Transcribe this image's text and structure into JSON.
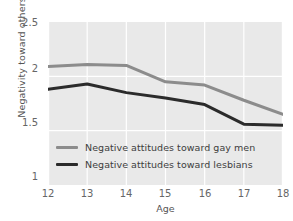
{
  "chart_data": {
    "type": "line",
    "title": "",
    "xlabel": "Age",
    "ylabel": "Negativity toward others",
    "x": [
      12,
      13,
      14,
      15,
      16,
      17,
      18
    ],
    "xticklabels": [
      "12",
      "13",
      "14",
      "15",
      "16",
      "17",
      "18"
    ],
    "yticklabels": [
      "1",
      "1.5",
      "2",
      "2.5"
    ],
    "yticks": [
      1,
      1.5,
      2,
      2.5
    ],
    "xlim": [
      12,
      18
    ],
    "ylim": [
      1,
      2.5
    ],
    "grid": true,
    "legend_position": "lower-left-inside",
    "plot_background": "#e9e9e9",
    "gridline_color": "#ffffff",
    "series": [
      {
        "name": "Negative attitudes toward gay men",
        "color": "#8c8c8c",
        "values": [
          2.09,
          2.11,
          2.1,
          1.95,
          1.92,
          1.78,
          1.65
        ]
      },
      {
        "name": "Negative attitudes toward lesbians",
        "color": "#2b2b2b",
        "values": [
          1.88,
          1.93,
          1.85,
          1.8,
          1.74,
          1.56,
          1.55
        ]
      }
    ]
  }
}
